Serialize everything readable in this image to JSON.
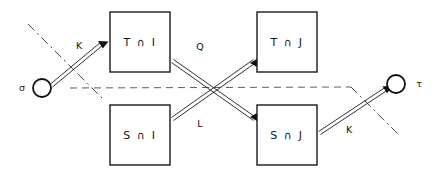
{
  "diagram": {
    "background_color": "#ffffff",
    "line_color": "#1b1b1b",
    "dashed_color": "#5d5d5d",
    "boxes": [
      {
        "id": "top-left",
        "label": "T ∩ I",
        "x": 110,
        "y": 12,
        "w": 60,
        "h": 60
      },
      {
        "id": "top-right",
        "label": "T ∩ J",
        "x": 257,
        "y": 12,
        "w": 60,
        "h": 60
      },
      {
        "id": "bottom-left",
        "label": "S ∩ I",
        "x": 110,
        "y": 105,
        "w": 60,
        "h": 60
      },
      {
        "id": "bottom-right",
        "label": "S ∩ J",
        "x": 257,
        "y": 105,
        "w": 60,
        "h": 60
      }
    ],
    "terminals": [
      {
        "id": "source",
        "label": "σ",
        "cx": 42,
        "cy": 88,
        "r": 9,
        "label_x": 22,
        "label_y": 88
      },
      {
        "id": "target",
        "label": "τ",
        "cx": 396,
        "cy": 84,
        "r": 9,
        "label_x": 419,
        "label_y": 84
      }
    ],
    "edge_labels": [
      {
        "id": "edge-source-to-top-left",
        "label": "K",
        "x": 79,
        "y": 46
      },
      {
        "id": "edge-top-left-to-bottom-right",
        "label": "Q",
        "x": 200,
        "y": 47
      },
      {
        "id": "edge-bottom-left-to-top-right",
        "label": "L",
        "x": 200,
        "y": 124
      },
      {
        "id": "edge-bottom-right-to-target",
        "label": "K",
        "x": 349,
        "y": 130
      }
    ],
    "annotations": {
      "horizontal_dashed_note": "dashed horizontal line through crossing point",
      "dashdot_left_note": "dash-dot diagonal near source",
      "dashdot_right_note": "dash-dot diagonal near target"
    }
  }
}
